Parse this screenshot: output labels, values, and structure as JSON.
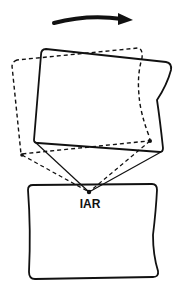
{
  "diagram": {
    "label": "IAR",
    "rotation_direction": "clockwise",
    "colors": {
      "stroke": "#111111",
      "background": "#ffffff"
    },
    "elements": [
      {
        "id": "rotation-arrow",
        "type": "curved-arrow",
        "description": "thick clockwise arrow above the figure"
      },
      {
        "id": "upper-body-solid",
        "type": "quadrilateral",
        "style": "solid",
        "description": "upper segment, rotated position"
      },
      {
        "id": "upper-body-dashed",
        "type": "quadrilateral",
        "style": "dashed",
        "description": "upper segment, initial position"
      },
      {
        "id": "lower-body",
        "type": "quadrilateral",
        "style": "solid",
        "description": "lower segment, fixed"
      },
      {
        "id": "iar-point",
        "type": "point",
        "description": "instantaneous axis of rotation"
      },
      {
        "id": "solid-lines",
        "type": "lines",
        "style": "solid",
        "description": "lines from solid body's lower corners to IAR"
      },
      {
        "id": "dashed-lines",
        "type": "lines",
        "style": "dashed",
        "description": "lines from dashed body's lower corners to IAR"
      }
    ]
  }
}
